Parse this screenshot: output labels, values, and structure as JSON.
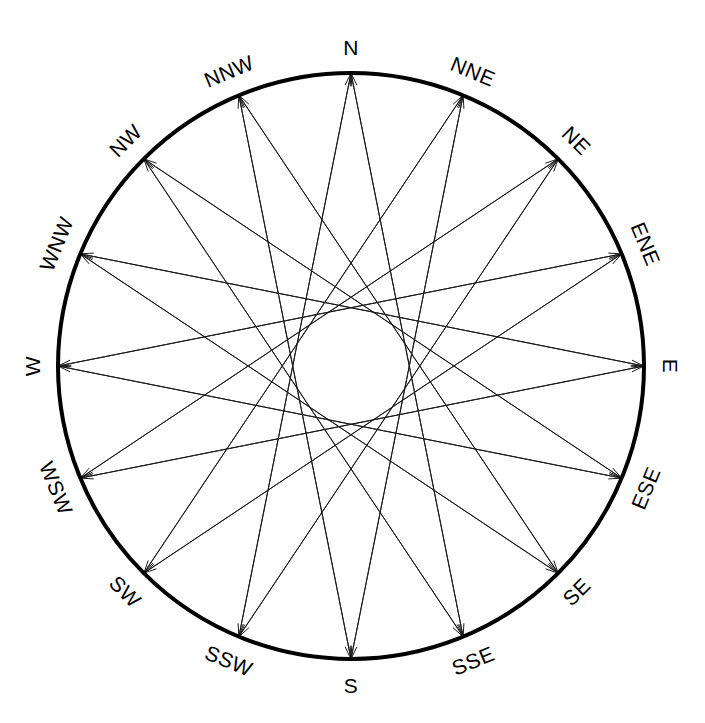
{
  "diagram": {
    "background_color": "#ffffff",
    "stroke_color": "#000000",
    "chord_color": "#1a1a1a",
    "center_x": 351,
    "center_y": 366,
    "outer_radius": 293,
    "outer_ring_width": 4,
    "label_radius_offset": 26,
    "inner_envelope_radius": 57,
    "chord_line_width": 1,
    "arrowhead_length": 13,
    "arrowhead_halfwidth": 3.4,
    "label_font_size": 21,
    "point_count": 16,
    "labels": [
      "N",
      "NNE",
      "NE",
      "ENE",
      "E",
      "ESE",
      "SE",
      "SSE",
      "S",
      "SSW",
      "SW",
      "WSW",
      "W",
      "WNW",
      "NW",
      "NNW"
    ],
    "bearings_deg": [
      0,
      22.5,
      45,
      67.5,
      90,
      112.5,
      135,
      157.5,
      180,
      202.5,
      225,
      247.5,
      270,
      292.5,
      315,
      337.5
    ],
    "chord_steps": [
      7,
      9
    ],
    "chord_count": 32
  },
  "chart_data": {
    "type": "scatter",
    "xlabel": "",
    "ylabel": "",
    "categories": [
      "N",
      "NNE",
      "NE",
      "ENE",
      "E",
      "ESE",
      "SE",
      "SSE",
      "S",
      "SSW",
      "SW",
      "WSW",
      "W",
      "WNW",
      "NW",
      "NNW"
    ],
    "values": [
      0,
      22.5,
      45,
      67.5,
      90,
      112.5,
      135,
      157.5,
      180,
      202.5,
      225,
      247.5,
      270,
      292.5,
      315,
      337.5
    ],
    "series": [
      {
        "name": "chords-step-7",
        "values": [
          [
            0,
            7
          ],
          [
            1,
            8
          ],
          [
            2,
            9
          ],
          [
            3,
            10
          ],
          [
            4,
            11
          ],
          [
            5,
            12
          ],
          [
            6,
            13
          ],
          [
            7,
            14
          ],
          [
            8,
            15
          ],
          [
            9,
            0
          ],
          [
            10,
            1
          ],
          [
            11,
            2
          ],
          [
            12,
            3
          ],
          [
            13,
            4
          ],
          [
            14,
            5
          ],
          [
            15,
            6
          ]
        ]
      },
      {
        "name": "chords-step-9",
        "values": [
          [
            0,
            9
          ],
          [
            1,
            10
          ],
          [
            2,
            11
          ],
          [
            3,
            12
          ],
          [
            4,
            13
          ],
          [
            5,
            14
          ],
          [
            6,
            15
          ],
          [
            7,
            0
          ],
          [
            8,
            1
          ],
          [
            9,
            2
          ],
          [
            10,
            3
          ],
          [
            11,
            4
          ],
          [
            12,
            5
          ],
          [
            13,
            6
          ],
          [
            14,
            7
          ],
          [
            15,
            8
          ]
        ]
      }
    ],
    "legend_position": "none",
    "grid": false,
    "xlim": [
      -1,
      1
    ],
    "ylim": [
      -1,
      1
    ]
  }
}
